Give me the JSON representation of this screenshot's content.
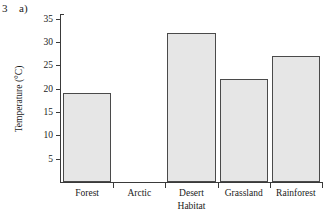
{
  "figure": {
    "number": "3",
    "part": "a)"
  },
  "chart_data": {
    "type": "bar",
    "title": "",
    "categories": [
      "Forest",
      "Arctic",
      "Desert",
      "Grassland",
      "Rainforest"
    ],
    "values": [
      19,
      null,
      32,
      22,
      27
    ],
    "series": [
      {
        "name": "Temperature",
        "values": [
          19,
          null,
          32,
          22,
          27
        ]
      }
    ],
    "xlabel": "Habitat",
    "ylabel": "Temperature (°C)",
    "ylim": [
      0,
      36
    ],
    "yticks": [
      5,
      10,
      15,
      20,
      25,
      30,
      35
    ],
    "ytick_labels": [
      "5",
      "10",
      "15",
      "20",
      "25",
      "30",
      "35"
    ],
    "grid": false,
    "legend": null
  },
  "style": {
    "bar_fill": "#e6e6e6",
    "bar_border": "#4a4a4a",
    "axis_color": "#3a3a3a",
    "background": "#ffffff"
  }
}
